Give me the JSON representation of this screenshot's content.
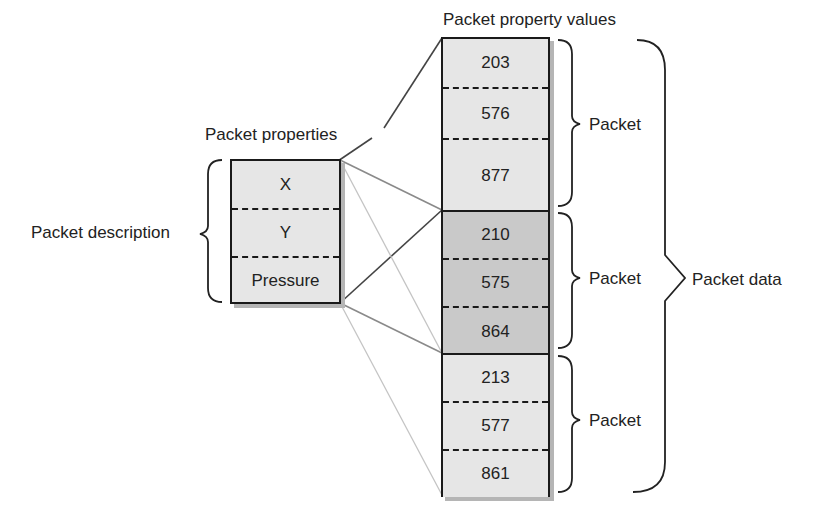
{
  "diagram": {
    "title_values": "Packet property values",
    "title_properties": "Packet properties",
    "description_label": "Packet description",
    "packet_data_label": "Packet data",
    "properties": [
      {
        "name": "X"
      },
      {
        "name": "Y"
      },
      {
        "name": "Pressure"
      }
    ],
    "packets": [
      {
        "label": "Packet",
        "values": [
          "203",
          "576",
          "877"
        ],
        "highlighted": false
      },
      {
        "label": "Packet",
        "values": [
          "210",
          "575",
          "864"
        ],
        "highlighted": true
      },
      {
        "label": "Packet",
        "values": [
          "213",
          "577",
          "861"
        ],
        "highlighted": false
      }
    ],
    "colors": {
      "cell_fill": "#e6e6e6",
      "highlight_fill": "#c9c9c9",
      "border": "#1a1a1a",
      "shadow": "#b5b5b5",
      "connector_dark": "#555555",
      "connector_mid": "#8a8a8a",
      "connector_light": "#c4c4c4"
    }
  }
}
